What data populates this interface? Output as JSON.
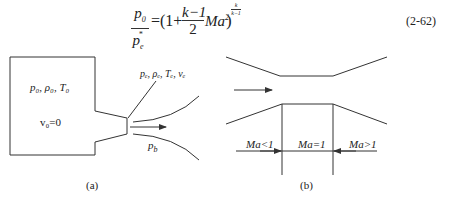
{
  "equation": {
    "lhs_numerator": "p",
    "lhs_numerator_sub": "0",
    "lhs_denominator": "p",
    "lhs_denominator_sub": "e",
    "lhs_denominator_sup": "*",
    "equals_open": "=(1+",
    "frac_numerator": "k−1",
    "frac_denominator": "2",
    "ma": "Ma",
    "ma_sup": "2",
    "close": ")",
    "exponent_num": "k",
    "exponent_den": "k−1",
    "number": "(2-62)"
  },
  "figure_a": {
    "chamber_label": "p₀, ρ₀, T₀",
    "velocity_label": "v₀=0",
    "exit_label": "pₑ, ρₑ, Tₑ, vₑ",
    "back_pressure_label": "p_b",
    "back_pressure_main": "p",
    "back_pressure_sub": "b",
    "caption": "(a)"
  },
  "figure_b": {
    "region_subsonic": "Ma<1",
    "region_sonic": "Ma=1",
    "region_supersonic": "Ma>1",
    "caption": "(b)"
  },
  "colors": {
    "line": "#333333",
    "text": "#222222",
    "background": "#ffffff"
  }
}
